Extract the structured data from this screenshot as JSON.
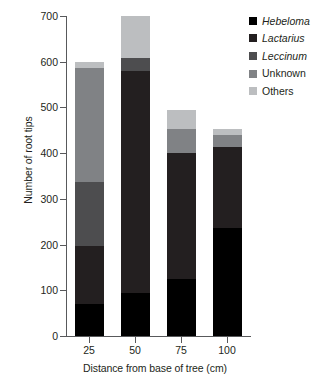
{
  "chart_data": {
    "type": "bar",
    "subtype": "stacked-bar",
    "title": "",
    "xlabel": "Distance from base of tree (cm)",
    "ylabel": "Number of root tips",
    "categories": [
      "25",
      "50",
      "75",
      "100"
    ],
    "ylim": [
      0,
      700
    ],
    "yticks": [
      0,
      100,
      200,
      300,
      400,
      500,
      600,
      700
    ],
    "ytick_labels": [
      "0",
      "100",
      "200",
      "300",
      "400",
      "500",
      "600",
      "700"
    ],
    "grid": false,
    "legend_position": "top-right",
    "series": [
      {
        "name": "Hebeloma",
        "italic": true,
        "color": "#000000",
        "values": [
          70,
          95,
          125,
          236
        ]
      },
      {
        "name": "Lactarius",
        "italic": true,
        "color": "#231f20",
        "values": [
          128,
          485,
          275,
          177
        ]
      },
      {
        "name": "Leccinum",
        "italic": true,
        "color": "#4d4d4f",
        "values": [
          140,
          28,
          0,
          0
        ]
      },
      {
        "name": "Unknown",
        "italic": false,
        "color": "#808285",
        "values": [
          248,
          0,
          52,
          27
        ]
      },
      {
        "name": "Others",
        "italic": false,
        "color": "#bcbec0",
        "values": [
          14,
          92,
          43,
          12
        ]
      }
    ],
    "totals": [
      600,
      700,
      495,
      452
    ]
  },
  "axes": {
    "y_title": "Number of root tips",
    "x_title": "Distance from base of tree (cm)"
  },
  "colors": {
    "background": "#ffffff",
    "axis": "#58595b",
    "text": "#231f20"
  }
}
